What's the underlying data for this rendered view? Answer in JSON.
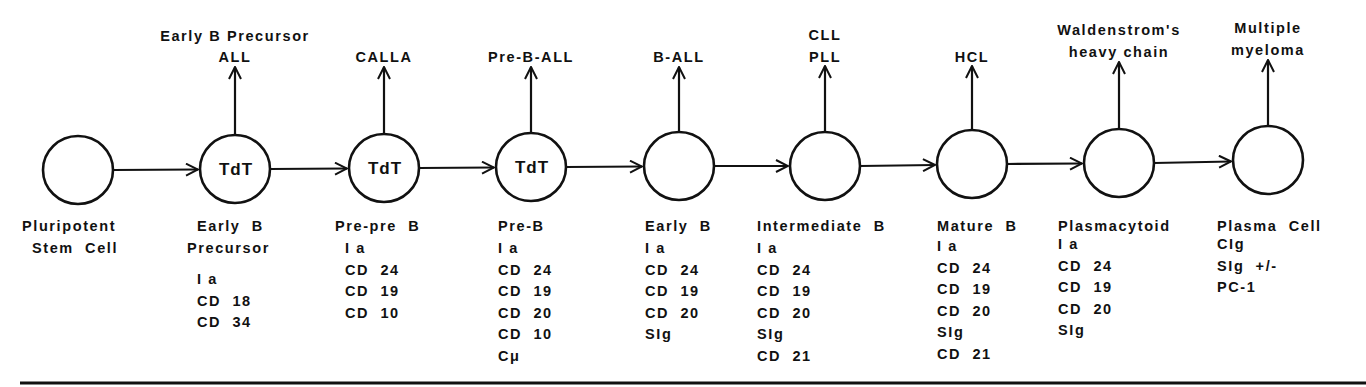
{
  "colors": {
    "ink": "#111111",
    "background": "#ffffff"
  },
  "nodes": [
    {
      "id": "pluripotent-stem-cell",
      "cx": 78,
      "cy": 170,
      "inner": "",
      "malignancy": [],
      "stage": [
        "Pluripotent",
        "Stem  Cell"
      ],
      "stage_x": [
        22,
        32
      ],
      "markers": [],
      "marker_x": 0
    },
    {
      "id": "early-b-precursor",
      "cx": 235,
      "cy": 169,
      "inner": "TdT",
      "malignancy": [
        "Early  B  Precursor",
        "ALL"
      ],
      "malignancy_y": [
        41,
        62
      ],
      "arrow_top": 67,
      "stage": [
        "Early  B",
        "Precursor"
      ],
      "stage_x": [
        197,
        187
      ],
      "markers": [
        "I a",
        "CD  18",
        "CD  34"
      ],
      "marker_x": 197,
      "marker_start": 284
    },
    {
      "id": "pre-pre-b",
      "cx": 384,
      "cy": 168,
      "inner": "TdT",
      "malignancy": [
        "CALLA"
      ],
      "malignancy_y": [
        62
      ],
      "arrow_top": 67,
      "stage": [
        "Pre-pre  B"
      ],
      "stage_x": [
        335
      ],
      "markers": [
        "I a",
        "CD  24",
        "CD  19",
        "CD  10"
      ],
      "marker_x": 345,
      "marker_start": 253
    },
    {
      "id": "pre-b",
      "cx": 531,
      "cy": 167,
      "inner": "TdT",
      "malignancy": [
        "Pre-B-ALL"
      ],
      "malignancy_y": [
        62
      ],
      "arrow_top": 67,
      "stage": [
        "Pre-B"
      ],
      "stage_x": [
        498
      ],
      "markers": [
        "I a",
        "CD  24",
        "CD  19",
        "CD  20",
        "CD  10",
        "Cμ"
      ],
      "marker_x": 498,
      "marker_start": 253
    },
    {
      "id": "early-b",
      "cx": 679,
      "cy": 166,
      "inner": "",
      "malignancy": [
        "B-ALL"
      ],
      "malignancy_y": [
        62
      ],
      "arrow_top": 67,
      "stage": [
        "Early  B"
      ],
      "stage_x": [
        645
      ],
      "markers": [
        "I a",
        "CD  24",
        "CD  19",
        "CD  20",
        "SIg"
      ],
      "marker_x": 645,
      "marker_start": 253
    },
    {
      "id": "intermediate-b",
      "cx": 825,
      "cy": 166,
      "inner": "",
      "malignancy": [
        "CLL",
        "PLL"
      ],
      "malignancy_y": [
        40,
        62
      ],
      "arrow_top": 66,
      "stage": [
        "Intermediate  B"
      ],
      "stage_x": [
        757
      ],
      "markers": [
        "I a",
        "CD  24",
        "CD  19",
        "CD  20",
        "SIg",
        "CD  21"
      ],
      "marker_x": 757,
      "marker_start": 253
    },
    {
      "id": "mature-b",
      "cx": 972,
      "cy": 164,
      "inner": "",
      "malignancy": [
        "HCL"
      ],
      "malignancy_y": [
        62
      ],
      "arrow_top": 66,
      "stage": [
        "Mature  B"
      ],
      "stage_x": [
        937
      ],
      "markers": [
        "I a",
        "CD  24",
        "CD  19",
        "CD  20",
        "SIg",
        "CD  21"
      ],
      "marker_x": 937,
      "marker_start": 251
    },
    {
      "id": "plasmacytoid",
      "cx": 1119,
      "cy": 163,
      "inner": "",
      "malignancy": [
        "Waldenstrom's",
        "heavy  chain"
      ],
      "malignancy_y": [
        35,
        57
      ],
      "arrow_top": 62,
      "stage": [
        "Plasmacytoid"
      ],
      "stage_x": [
        1058
      ],
      "markers": [
        "I a",
        "CD  24",
        "CD  19",
        "CD  20",
        "SIg"
      ],
      "marker_x": 1058,
      "marker_start": 249
    },
    {
      "id": "plasma-cell",
      "cx": 1268,
      "cy": 160,
      "inner": "",
      "malignancy": [
        "Multiple",
        "myeloma"
      ],
      "malignancy_y": [
        33,
        55
      ],
      "arrow_top": 60,
      "stage": [
        "Plasma  Cell"
      ],
      "stage_x": [
        1217
      ],
      "markers": [
        "CIg",
        "SIg  +/-",
        "PC-1"
      ],
      "marker_x": 1217,
      "marker_start": 249
    }
  ],
  "layout": {
    "radius": 35,
    "stage_start_y": 231,
    "line_step": 21.5,
    "rule_y": 383
  }
}
